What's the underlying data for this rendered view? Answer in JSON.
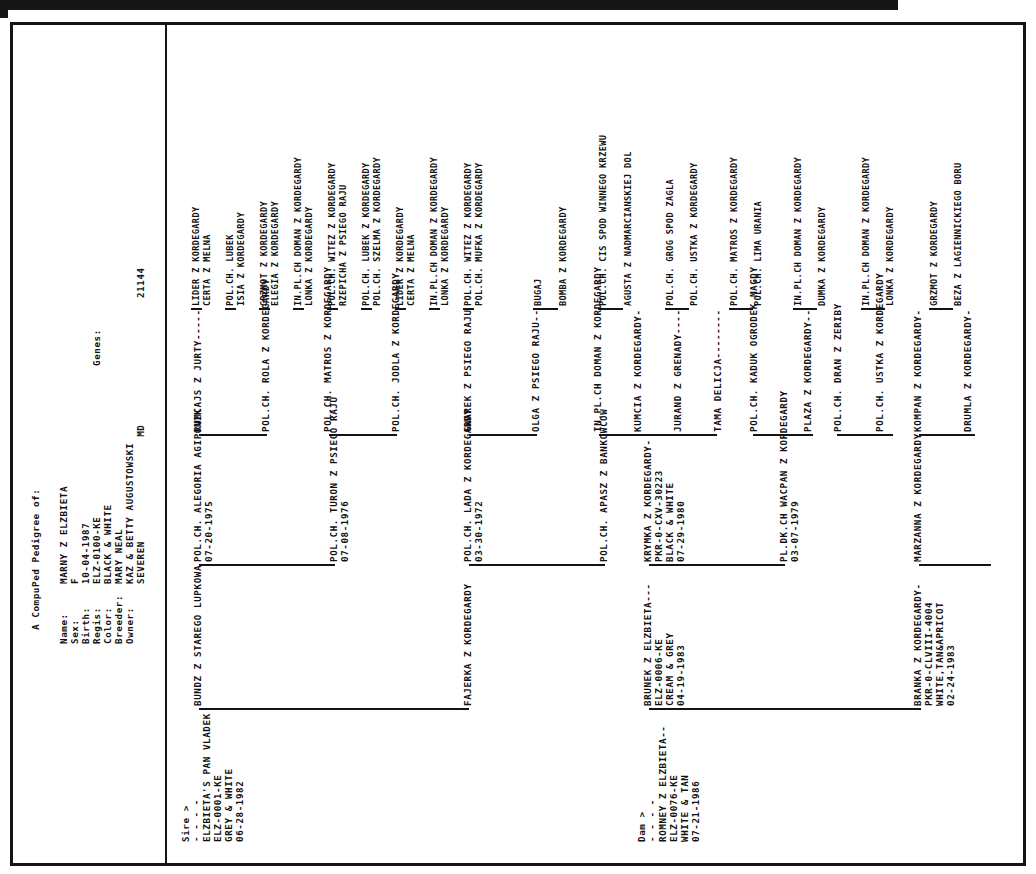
{
  "document": {
    "title": "A CompuPed Pedigree of:",
    "genes_label": "Genes:",
    "genes_value": "21144"
  },
  "subject": {
    "fields": [
      {
        "label": "Name:",
        "value": "MARNY Z ELZBIETA"
      },
      {
        "label": "Sex:",
        "value": "F"
      },
      {
        "label": "Birth:",
        "value": "10-04-1987"
      },
      {
        "label": "Regis:",
        "value": "ELZ-0100-KE"
      },
      {
        "label": "Color:",
        "value": "BLACK & WHITE"
      },
      {
        "label": "Breeder:",
        "value": "MARY NEAL"
      },
      {
        "label": "Owner:",
        "value": "KAZ & BETTY AUGUSTOWSKI"
      },
      {
        "label": "",
        "value": "SEVEREN                 MD"
      }
    ]
  },
  "sire": {
    "marker": "Sire >",
    "dashes": "- - - -",
    "name": "ELZBIETA'S PAN VLADEK",
    "regis": "ELZ-0001-KE",
    "color": "GREY & WHITE",
    "birth": "06-28-1982"
  },
  "dam": {
    "marker": "Dam >",
    "dashes": "- - - -",
    "name": "ROMNEY Z ELZBIETA--",
    "regis": "ELZ-0076-KE",
    "color": "WHITE & TAN",
    "birth": "07-21-1986"
  },
  "gen2": [
    {
      "name": "BUNDZ Z STAREGO LUPKOWA",
      "regis": "",
      "color": "",
      "birth": ""
    },
    {
      "name": "FAJERKA Z KORDEGARDY",
      "regis": "",
      "color": "",
      "birth": ""
    },
    {
      "name": "BRUNEK Z ELZBIETA---",
      "regis": "ELZ-0006-KE",
      "color": "CREAM & GREY",
      "birth": "04-19-1983"
    },
    {
      "name": "BRANKA Z KORDEGARDY-",
      "regis": "PKR-0-CLVIII-4004",
      "color": "WHITE,TAN&APRICOT",
      "birth": "02-24-1983"
    }
  ],
  "gen3": [
    {
      "name": "POL.CH. ALEGORIA AGIPONIK",
      "birth": "07-20-1975"
    },
    {
      "name": "POL.CH. TURON Z PSIEGO RAJU",
      "birth": "07-08-1976"
    },
    {
      "name": "POL.CH. LADA Z KORDEGARDY",
      "birth": "03-30-1972"
    },
    {
      "name": "POL.CH. APASZ Z BANKOWCOW",
      "birth": ""
    },
    {
      "name": "KRYMKA Z KORDEGARDY-",
      "regis": "PKR-0-CXV-30223",
      "color": "BLACK & WHITE",
      "birth": "07-29-1980"
    },
    {
      "name": "PL.DK.CH WACPAN Z KORDEGARDY",
      "birth": "03-07-1979"
    },
    {
      "name": "MARZANNA Z KORDEGARDY",
      "birth": ""
    }
  ],
  "gen4": [
    {
      "name": "RUMCAJS Z JURTY-----"
    },
    {
      "name": "POL.CH. ROLA Z KORDEGARDY"
    },
    {
      "name": "POL.CH. MATROS Z KORDEGARDY"
    },
    {
      "name": "POL.CH. JODLA Z KORDEGARDY"
    },
    {
      "name": "GWAREK Z PSIEGO RAJU"
    },
    {
      "name": "OLGA Z PSIEGO RAJU--"
    },
    {
      "name": "IN.PL.CH DOMAN Z KORDEGARDY"
    },
    {
      "name": "KUMCIA Z KORDEGARDY-"
    },
    {
      "name": "JURAND Z GRENADY----"
    },
    {
      "name": "TAMA DELICJA--------"
    },
    {
      "name": "POL.CH. KADUK OGRODEK MAGDY"
    },
    {
      "name": "PLAZA Z KORDEGARDY--"
    },
    {
      "name": "POL.CH. DRAN Z ZERIBY"
    },
    {
      "name": "POL.CH. USTKA Z KORDEGARDY"
    },
    {
      "name": "KOMPAN Z KORDEGARDY-"
    },
    {
      "name": "DRUMLA Z KORDEGARDY-"
    }
  ],
  "gen5": [
    {
      "name": "LIDER Z KORDEGARDY"
    },
    {
      "name": "CERTA Z MELNA"
    },
    {
      "name": "POL.CH. LUBEK"
    },
    {
      "name": "ISIA Z KORDEGARDY"
    },
    {
      "name": "GRZMOT Z KORDEGARDY"
    },
    {
      "name": "ELEGIA Z KORDEGARDY"
    },
    {
      "name": "IN.PL.CH DOMAN Z KORDEGARDY"
    },
    {
      "name": "LONKA Z KORDEGARDY"
    },
    {
      "name": "POL.CH. WITEZ Z KORDEGARDY"
    },
    {
      "name": "RZEPICHA Z PSIEGO RAJU"
    },
    {
      "name": "POL.CH. LUBEK Z KORDEGARDY"
    },
    {
      "name": "POL.CH. SZELMA Z KORDEGARDY"
    },
    {
      "name": "LIDER Z KORDEGARDY"
    },
    {
      "name": "CERTA Z MELNA"
    },
    {
      "name": "IN.PL.CH DOMAN Z KORDEGARDY"
    },
    {
      "name": "LONKA Z KORDEGARDY"
    },
    {
      "name": "POL.CH. WITEZ Z KORDEGARDY"
    },
    {
      "name": "POL.CH. MUFKA Z KORDEGARDY"
    },
    {
      "name": "BUGAJ"
    },
    {
      "name": "BOMBA Z KORDEGARDY"
    },
    {
      "name": "POL.CH. CIS SPOD WINNEGO KRZEWU"
    },
    {
      "name": "AGUSTA Z NADMARCIANSKIEJ DOL"
    },
    {
      "name": "POL.CH. GROG SPOD ZAGLA"
    },
    {
      "name": "POL.CH. USTKA Z KORDEGARDY"
    },
    {
      "name": "POL.CH. MATROS Z KORDEGARDY"
    },
    {
      "name": "POL.CH. LIMA URANIA"
    },
    {
      "name": "IN.PL.CH DOMAN Z KORDEGARDY"
    },
    {
      "name": "DUMKA Z KORDEGARDY"
    },
    {
      "name": "IN.PL.CH DOMAN Z KORDEGARDY"
    },
    {
      "name": "LONKA Z KORDEGARDY"
    },
    {
      "name": "GRZMOT Z KORDEGARDY"
    },
    {
      "name": "BEZA Z LAGIENNICKIEGO BORU"
    }
  ]
}
